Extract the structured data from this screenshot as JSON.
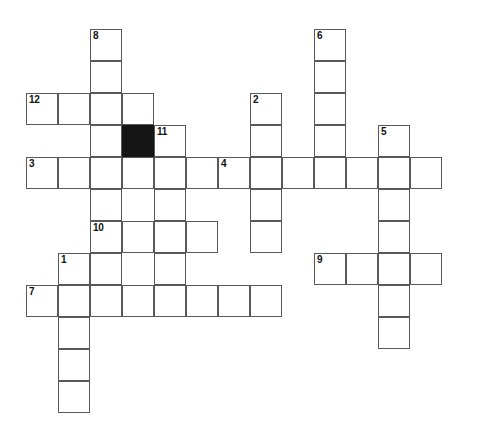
{
  "puzzle": {
    "title": "Crossword Puzzle Grid",
    "cell_size": 32,
    "origin_x": 26,
    "origin_y": 29,
    "grid_cols": 14,
    "grid_rows": 12,
    "colors": {
      "background": "#ffffff",
      "cell_fill": "#ffffff",
      "cell_border": "#58595b",
      "block_fill": "#151515",
      "number_text": "#111111"
    },
    "clue_numbers": [
      "1",
      "2",
      "3",
      "4",
      "5",
      "6",
      "7",
      "8",
      "9",
      "10",
      "11",
      "12"
    ],
    "cells": [
      {
        "col": 2,
        "row": 0,
        "num": "8",
        "black": false
      },
      {
        "col": 2,
        "row": 1,
        "num": "",
        "black": false
      },
      {
        "col": 0,
        "row": 2,
        "num": "12",
        "black": false
      },
      {
        "col": 1,
        "row": 2,
        "num": "",
        "black": false
      },
      {
        "col": 2,
        "row": 2,
        "num": "",
        "black": false
      },
      {
        "col": 3,
        "row": 2,
        "num": "",
        "black": false
      },
      {
        "col": 2,
        "row": 3,
        "num": "",
        "black": false
      },
      {
        "col": 3,
        "row": 3,
        "num": "",
        "black": true
      },
      {
        "col": 4,
        "row": 3,
        "num": "11",
        "black": false
      },
      {
        "col": 0,
        "row": 4,
        "num": "3",
        "black": false
      },
      {
        "col": 1,
        "row": 4,
        "num": "",
        "black": false
      },
      {
        "col": 2,
        "row": 4,
        "num": "",
        "black": false
      },
      {
        "col": 3,
        "row": 4,
        "num": "",
        "black": false
      },
      {
        "col": 4,
        "row": 4,
        "num": "",
        "black": false
      },
      {
        "col": 5,
        "row": 4,
        "num": "",
        "black": false
      },
      {
        "col": 2,
        "row": 5,
        "num": "",
        "black": false
      },
      {
        "col": 4,
        "row": 5,
        "num": "",
        "black": false
      },
      {
        "col": 2,
        "row": 6,
        "num": "10",
        "black": false
      },
      {
        "col": 3,
        "row": 6,
        "num": "",
        "black": false
      },
      {
        "col": 4,
        "row": 6,
        "num": "",
        "black": false
      },
      {
        "col": 5,
        "row": 6,
        "num": "",
        "black": false
      },
      {
        "col": 1,
        "row": 7,
        "num": "1",
        "black": false
      },
      {
        "col": 2,
        "row": 7,
        "num": "",
        "black": false
      },
      {
        "col": 4,
        "row": 7,
        "num": "",
        "black": false
      },
      {
        "col": 0,
        "row": 8,
        "num": "7",
        "black": false
      },
      {
        "col": 1,
        "row": 8,
        "num": "",
        "black": false
      },
      {
        "col": 2,
        "row": 8,
        "num": "",
        "black": false
      },
      {
        "col": 3,
        "row": 8,
        "num": "",
        "black": false
      },
      {
        "col": 4,
        "row": 8,
        "num": "",
        "black": false
      },
      {
        "col": 5,
        "row": 8,
        "num": "",
        "black": false
      },
      {
        "col": 6,
        "row": 8,
        "num": "",
        "black": false
      },
      {
        "col": 7,
        "row": 8,
        "num": "",
        "black": false
      },
      {
        "col": 1,
        "row": 9,
        "num": "",
        "black": false
      },
      {
        "col": 1,
        "row": 10,
        "num": "",
        "black": false
      },
      {
        "col": 1,
        "row": 11,
        "num": "",
        "black": false
      },
      {
        "col": 9,
        "row": 0,
        "num": "6",
        "black": false
      },
      {
        "col": 9,
        "row": 1,
        "num": "",
        "black": false
      },
      {
        "col": 7,
        "row": 2,
        "num": "2",
        "black": false
      },
      {
        "col": 9,
        "row": 2,
        "num": "",
        "black": false
      },
      {
        "col": 7,
        "row": 3,
        "num": "",
        "black": false
      },
      {
        "col": 9,
        "row": 3,
        "num": "",
        "black": false
      },
      {
        "col": 11,
        "row": 3,
        "num": "5",
        "black": false
      },
      {
        "col": 6,
        "row": 4,
        "num": "4",
        "black": false
      },
      {
        "col": 7,
        "row": 4,
        "num": "",
        "black": false
      },
      {
        "col": 8,
        "row": 4,
        "num": "",
        "black": false
      },
      {
        "col": 9,
        "row": 4,
        "num": "",
        "black": false
      },
      {
        "col": 10,
        "row": 4,
        "num": "",
        "black": false
      },
      {
        "col": 11,
        "row": 4,
        "num": "",
        "black": false
      },
      {
        "col": 12,
        "row": 4,
        "num": "",
        "black": false
      },
      {
        "col": 7,
        "row": 5,
        "num": "",
        "black": false
      },
      {
        "col": 11,
        "row": 5,
        "num": "",
        "black": false
      },
      {
        "col": 7,
        "row": 6,
        "num": "",
        "black": false
      },
      {
        "col": 11,
        "row": 6,
        "num": "",
        "black": false
      },
      {
        "col": 9,
        "row": 7,
        "num": "9",
        "black": false
      },
      {
        "col": 10,
        "row": 7,
        "num": "",
        "black": false
      },
      {
        "col": 11,
        "row": 7,
        "num": "",
        "black": false
      },
      {
        "col": 12,
        "row": 7,
        "num": "",
        "black": false
      },
      {
        "col": 11,
        "row": 8,
        "num": "",
        "black": false
      },
      {
        "col": 11,
        "row": 9,
        "num": "",
        "black": false
      }
    ]
  }
}
